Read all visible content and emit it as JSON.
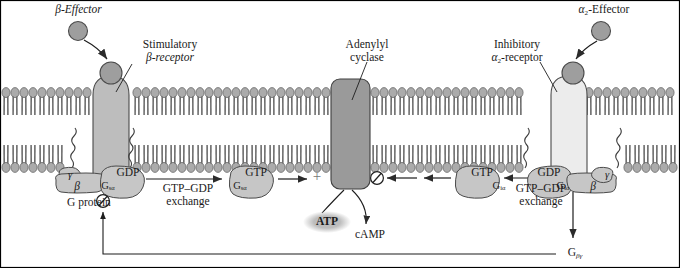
{
  "figure": {
    "domain_type": "diagram",
    "width": 680,
    "height": 268
  },
  "colors": {
    "background": "#ffffff",
    "border": "#000000",
    "membrane_head": "#a8a8a8",
    "membrane_tail": "#8e8e8e",
    "receptor_stimulatory": "#b9b9b9",
    "receptor_inhibitory": "#e8e8e8",
    "effector_ball": "#9e9e9e",
    "cyclase": "#9a9a9a",
    "gprotein_fill": "#c4c4c4",
    "atp_ellipse": "#bdbdbd",
    "text": "#1a1a1a",
    "arrow": "#2b2b2b"
  },
  "labels": {
    "beta_effector": "β-Effector",
    "stimulatory_receptor_line1": "Stimulatory",
    "stimulatory_receptor_line2": "β-receptor",
    "adenylyl_cyclase_line1": "Adenylyl",
    "adenylyl_cyclase_line2": "cyclase",
    "inhibitory_receptor_line1": "Inhibitory",
    "inhibitory_receptor_line2": "α2-receptor",
    "alpha2_effector": "α2-Effector",
    "g_protein": "G protein",
    "exchange_left_line1": "GTP–GDP",
    "exchange_left_line2": "exchange",
    "exchange_right_line1": "GTP–GDP",
    "exchange_right_line2": "exchange",
    "atp": "ATP",
    "camp": "cAMP",
    "plus_sign": "+"
  },
  "subunits": {
    "left_complex": {
      "gamma": "γ",
      "beta": "β",
      "alpha": "G",
      "alpha_sub": "sα",
      "nucleotide": "GDP"
    },
    "left_free": {
      "alpha": "G",
      "alpha_sub": "sα",
      "nucleotide": "GTP"
    },
    "right_free": {
      "alpha": "G",
      "alpha_sub": "iα",
      "nucleotide": "GTP"
    },
    "right_complex": {
      "gamma": "γ",
      "beta": "β",
      "alpha": "G",
      "alpha_sub": "iα",
      "nucleotide": "GDP"
    },
    "g_beta_gamma": {
      "base": "G",
      "sub": "βγ"
    }
  },
  "symbols": {
    "inhibition_left": "circle-slash",
    "inhibition_right": "circle-slash",
    "activation": "plus"
  }
}
